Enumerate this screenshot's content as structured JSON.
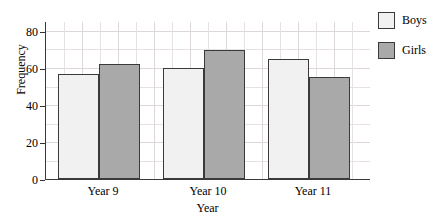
{
  "chart_data": {
    "type": "bar",
    "title": "",
    "subtitle": "",
    "xlabel": "Year",
    "ylabel": "Frequency",
    "categories": [
      "Year 9",
      "Year 10",
      "Year 11"
    ],
    "series": [
      {
        "name": "Boys",
        "values": [
          57,
          60,
          65
        ],
        "color": "#f1f1f1"
      },
      {
        "name": "Girls",
        "values": [
          62,
          70,
          55
        ],
        "color": "#a9a9a9"
      }
    ],
    "ylim": [
      0,
      85
    ],
    "yticks": [
      0,
      20,
      40,
      60,
      80
    ],
    "ytick_labels": [
      "0",
      "20",
      "40",
      "60",
      "80"
    ],
    "grid": true,
    "grid_minor": true,
    "legend_position": "right-top",
    "bar_edge_color": "#3a3a3a",
    "axis_color": "#3a3a3a",
    "grid_color": "#e7e2e2"
  },
  "legend": {
    "entries": [
      {
        "label": "Boys",
        "swatch": "boys"
      },
      {
        "label": "Girls",
        "swatch": "girls"
      }
    ]
  },
  "axes": {
    "y_title": "Frequency",
    "x_title": "Year",
    "y_tick_0": "0",
    "y_tick_1": "20",
    "y_tick_2": "40",
    "y_tick_3": "60",
    "y_tick_4": "80",
    "x_tick_0": "Year 9",
    "x_tick_1": "Year 10",
    "x_tick_2": "Year 11"
  }
}
